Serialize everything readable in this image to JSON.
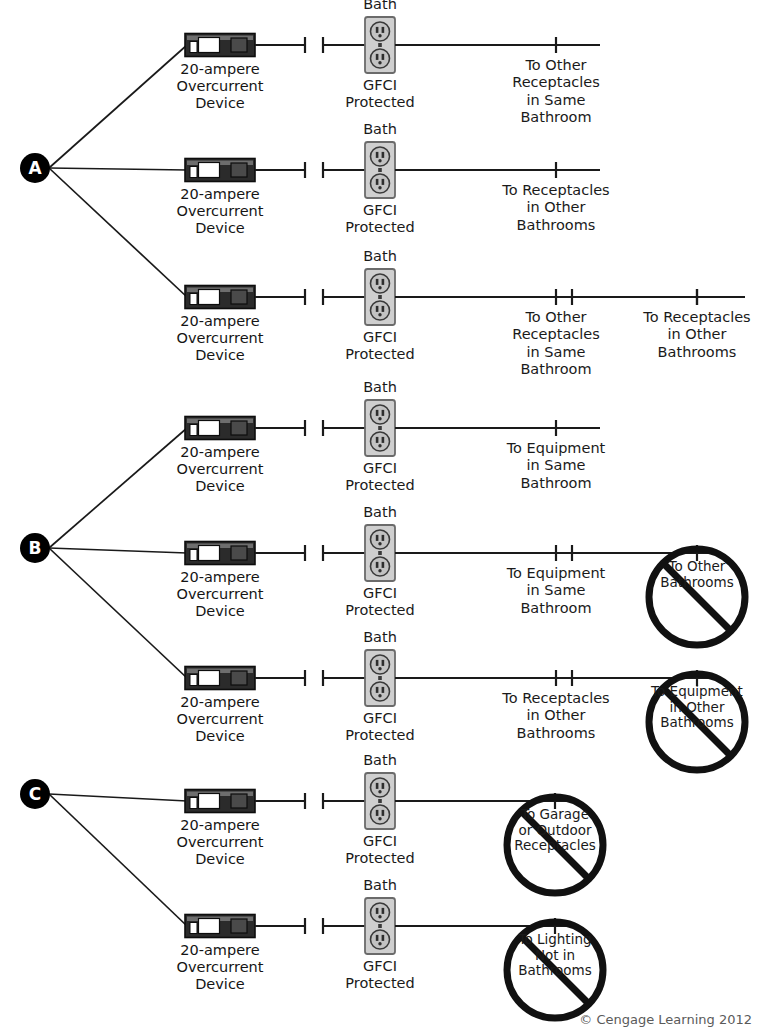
{
  "figure": {
    "footer": "© Cengage Learning 2012",
    "colors": {
      "line": "#1a1a1a",
      "breaker_body": "#2b2b2b",
      "breaker_toggle": "#ffffff",
      "breaker_panel": "#4a4a4a",
      "receptacle_face": "#cfcfcf",
      "receptacle_border": "#6b6b6b",
      "node_fill": "#000000",
      "node_text": "#ffffff",
      "prohibit": "#111111",
      "text": "#151515"
    },
    "common_labels": {
      "breaker": "20-ampere\nOvercurrent\nDevice",
      "bath": "Bath",
      "gfci": "GFCI\nProtected"
    },
    "icon_names": {
      "breaker": "circuit-breaker-icon",
      "receptacle": "duplex-receptacle-icon",
      "node": "branch-node-marker",
      "prohibit": "prohibition-slash-icon",
      "terminal": "wire-terminal-icon"
    }
  },
  "sections": [
    {
      "id": "A",
      "letter": "A",
      "node": {
        "cx": 35,
        "cy": 168
      },
      "rows": [
        {
          "y": 45,
          "breaker_x": 185,
          "receptacle_x": 380,
          "bath_label": "Bath",
          "gfci_label": "GFCI\nProtected",
          "breaker_label": "20-ampere\nOvercurrent\nDevice",
          "wire_end": 600,
          "destinations": [
            {
              "x": 556,
              "label": "To Other\nReceptacles\nin Same\nBathroom",
              "blocked": false
            }
          ]
        },
        {
          "y": 170,
          "breaker_x": 185,
          "receptacle_x": 380,
          "bath_label": "Bath",
          "gfci_label": "GFCI\nProtected",
          "breaker_label": "20-ampere\nOvercurrent\nDevice",
          "wire_end": 600,
          "destinations": [
            {
              "x": 556,
              "label": "To Receptacles\nin Other\nBathrooms",
              "blocked": false
            }
          ]
        },
        {
          "y": 297,
          "breaker_x": 185,
          "receptacle_x": 380,
          "bath_label": "Bath",
          "gfci_label": "GFCI\nProtected",
          "breaker_label": "20-ampere\nOvercurrent\nDevice",
          "wire_end": 745,
          "destinations": [
            {
              "x": 556,
              "label": "To Other\nReceptacles\nin Same\nBathroom",
              "blocked": false
            },
            {
              "x": 697,
              "label": "To Receptacles\nin Other\nBathrooms",
              "blocked": false
            }
          ]
        }
      ]
    },
    {
      "id": "B",
      "letter": "B",
      "node": {
        "cx": 35,
        "cy": 548
      },
      "rows": [
        {
          "y": 428,
          "breaker_x": 185,
          "receptacle_x": 380,
          "bath_label": "Bath",
          "gfci_label": "GFCI\nProtected",
          "breaker_label": "20-ampere\nOvercurrent\nDevice",
          "wire_end": 600,
          "destinations": [
            {
              "x": 556,
              "label": "To Equipment\nin Same\nBathroom",
              "blocked": false
            }
          ]
        },
        {
          "y": 553,
          "breaker_x": 185,
          "receptacle_x": 380,
          "bath_label": "Bath",
          "gfci_label": "GFCI\nProtected",
          "breaker_label": "20-ampere\nOvercurrent\nDevice",
          "wire_end": 720,
          "destinations": [
            {
              "x": 556,
              "label": "To Equipment\nin Same\nBathroom",
              "blocked": false
            },
            {
              "x": 697,
              "label": "To Other\nBathrooms",
              "blocked": true
            }
          ]
        },
        {
          "y": 678,
          "breaker_x": 185,
          "receptacle_x": 380,
          "bath_label": "Bath",
          "gfci_label": "GFCI\nProtected",
          "breaker_label": "20-ampere\nOvercurrent\nDevice",
          "wire_end": 720,
          "destinations": [
            {
              "x": 556,
              "label": "To Receptacles\nin Other\nBathrooms",
              "blocked": false
            },
            {
              "x": 697,
              "label": "To Equipment\nin Other\nBathrooms",
              "blocked": true
            }
          ]
        }
      ]
    },
    {
      "id": "C",
      "letter": "C",
      "node": {
        "cx": 35,
        "cy": 794
      },
      "rows": [
        {
          "y": 801,
          "breaker_x": 185,
          "receptacle_x": 380,
          "bath_label": "Bath",
          "gfci_label": "GFCI\nProtected",
          "breaker_label": "20-ampere\nOvercurrent\nDevice",
          "wire_end": 570,
          "destinations": [
            {
              "x": 555,
              "label": "To Garage\nor Outdoor\nReceptacles",
              "blocked": true
            }
          ]
        },
        {
          "y": 926,
          "breaker_x": 185,
          "receptacle_x": 380,
          "bath_label": "Bath",
          "gfci_label": "GFCI\nProtected",
          "breaker_label": "20-ampere\nOvercurrent\nDevice",
          "wire_end": 570,
          "destinations": [
            {
              "x": 555,
              "label": "To Lighting\nNot in\nBathrooms",
              "blocked": true
            }
          ]
        }
      ]
    }
  ]
}
